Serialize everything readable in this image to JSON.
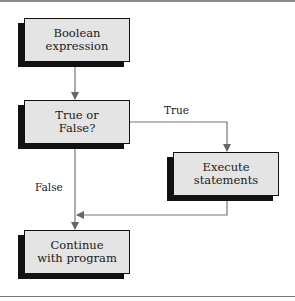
{
  "diagram": {
    "type": "flowchart",
    "nodes": [
      {
        "id": "boolean",
        "label": "Boolean\nexpression"
      },
      {
        "id": "decision",
        "label": "True or\nFalse?"
      },
      {
        "id": "execute",
        "label": "Execute\nstatements"
      },
      {
        "id": "continue",
        "label": "Continue\nwith program"
      }
    ],
    "edges": [
      {
        "from": "boolean",
        "to": "decision",
        "label": ""
      },
      {
        "from": "decision",
        "to": "execute",
        "label": "True"
      },
      {
        "from": "decision",
        "to": "continue",
        "label": "False"
      },
      {
        "from": "execute",
        "to": "continue",
        "label": ""
      }
    ],
    "edge_labels": {
      "true": "True",
      "false": "False"
    },
    "colors": {
      "box_fill": "#e4e4e4",
      "box_border": "#111111",
      "shadow": "#111111",
      "line": "#777777"
    }
  }
}
